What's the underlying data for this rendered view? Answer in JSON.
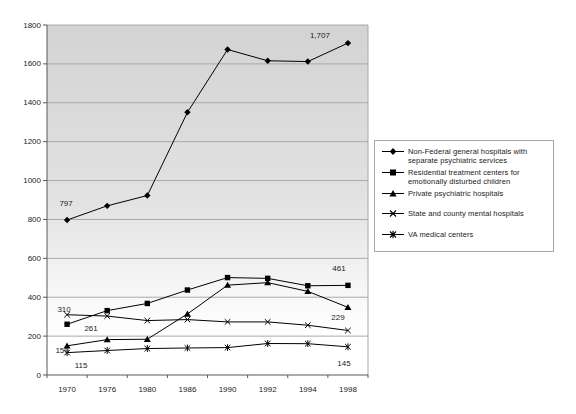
{
  "chart_data": {
    "type": "line",
    "title": "",
    "xlabel": "",
    "ylabel": "",
    "categories": [
      "1970",
      "1976",
      "1980",
      "1986",
      "1990",
      "1992",
      "1994",
      "1998"
    ],
    "series": [
      {
        "name": "Non-Federal general hospitals with separate psychiatric services",
        "marker": "diamond",
        "values": [
          797,
          870,
          923,
          1351,
          1674,
          1616,
          1612,
          1707
        ]
      },
      {
        "name": "Residential treatment centers for emotionally disturbed children",
        "marker": "square",
        "values": [
          261,
          331,
          368,
          437,
          501,
          497,
          459,
          461
        ]
      },
      {
        "name": "Private psychiatric hospitals",
        "marker": "triangle",
        "values": [
          150,
          182,
          184,
          314,
          462,
          475,
          430,
          348
        ]
      },
      {
        "name": "State and county mental hospitals",
        "marker": "x",
        "values": [
          310,
          303,
          280,
          285,
          273,
          273,
          256,
          229
        ]
      },
      {
        "name": "VA medical centers",
        "marker": "star",
        "values": [
          115,
          126,
          136,
          139,
          141,
          162,
          161,
          145
        ]
      }
    ],
    "ylim": [
      0,
      1800
    ],
    "ytick_step": 200,
    "yticks": [
      "0",
      "200",
      "400",
      "600",
      "800",
      "1000",
      "1200",
      "1400",
      "1600",
      "1800"
    ],
    "grid": true,
    "legend_position": "right",
    "line_color": "#000000",
    "grid_color": "#a9a9a9",
    "axis_color": "#595959",
    "plot_bg_top": "#d3d3d3",
    "plot_bg_bottom": "#ffffff",
    "annotations": [
      {
        "series": 0,
        "index": 0,
        "text": "797",
        "dx": -1,
        "dy": -14
      },
      {
        "series": 0,
        "index": 7,
        "text": "1,707",
        "dx": -28,
        "dy": -5
      },
      {
        "series": 1,
        "index": 0,
        "text": "261",
        "dx": 24,
        "dy": 7
      },
      {
        "series": 1,
        "index": 7,
        "text": "461",
        "dx": -9,
        "dy": -14
      },
      {
        "series": 2,
        "index": 0,
        "text": "150",
        "dx": -5,
        "dy": 7
      },
      {
        "series": 3,
        "index": 0,
        "text": "310",
        "dx": -3,
        "dy": -3
      },
      {
        "series": 3,
        "index": 7,
        "text": "229",
        "dx": -10,
        "dy": -10
      },
      {
        "series": 4,
        "index": 0,
        "text": "115",
        "dx": 14,
        "dy": 15
      },
      {
        "series": 4,
        "index": 7,
        "text": "145",
        "dx": -4,
        "dy": 19
      }
    ]
  }
}
